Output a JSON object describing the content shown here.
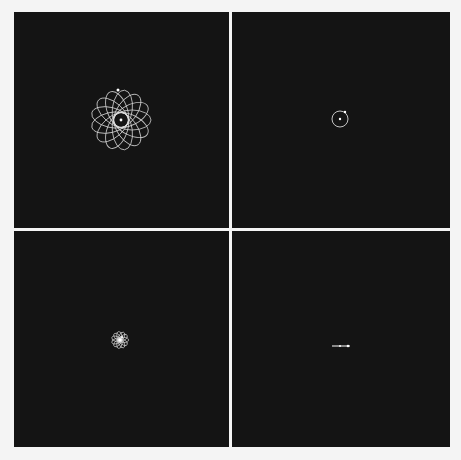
{
  "figure": {
    "layout": "2x2 grid of simulation frames",
    "background_color": "#f4f4f4",
    "panel_color": "#141414",
    "trace_color": "#d8d8d8",
    "body_color": "#ffffff",
    "panels": [
      {
        "id": "top-left",
        "description": "precessing elliptical orbit rosette",
        "center": [
          107,
          108
        ],
        "rosette": {
          "a": 19,
          "b": 10,
          "lobes": 13,
          "offset": 11
        },
        "orbiting_body": [
          104,
          78
        ]
      },
      {
        "id": "top-right",
        "description": "circular orbit",
        "center": [
          108,
          107
        ],
        "circle_radius": 8,
        "orbiting_body": [
          113,
          100
        ]
      },
      {
        "id": "bottom-left",
        "description": "small rosette orbit",
        "center": [
          106,
          109
        ],
        "rosette": {
          "a": 5,
          "b": 2.6,
          "lobes": 11,
          "offset": 3.5
        },
        "orbiting_body": [
          108,
          106
        ]
      },
      {
        "id": "bottom-right",
        "description": "degenerate linear orbit",
        "center": [
          108,
          115
        ],
        "line": {
          "x1": 100,
          "x2": 118,
          "y": 115
        },
        "orbiting_body": [
          116,
          115
        ]
      }
    ]
  }
}
